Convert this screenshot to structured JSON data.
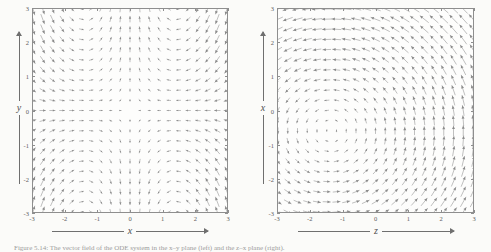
{
  "figure": {
    "caption": "Figure 5.14: The vector field of the ODE system in the x–y plane (left) and the z–x plane (right).",
    "caption_label": "Figure 5.14:"
  },
  "panels": [
    {
      "id": "left",
      "name": "xy-plane-quiver",
      "xlabel": "x",
      "ylabel": "y",
      "xticks": [
        "-3",
        "-2",
        "-1",
        "0",
        "1",
        "2",
        "3"
      ],
      "yticks": [
        "-3",
        "-2",
        "-1",
        "0",
        "1",
        "2",
        "3"
      ],
      "xlim": [
        -3,
        3
      ],
      "ylim": [
        -3,
        3
      ]
    },
    {
      "id": "right",
      "name": "zx-plane-quiver",
      "xlabel": "z",
      "ylabel": "x",
      "xticks": [
        "-3",
        "-2",
        "-1",
        "0",
        "1",
        "2",
        "3"
      ],
      "yticks": [
        "-3",
        "-2",
        "-1",
        "0",
        "1",
        "2",
        "3"
      ],
      "xlim": [
        -3,
        3
      ],
      "ylim": [
        -3,
        3
      ]
    }
  ],
  "chart_data": [
    {
      "type": "scatter",
      "subtype": "quiver",
      "panel": "left",
      "title": "",
      "xlabel": "x",
      "ylabel": "y",
      "xlim": [
        -3,
        3
      ],
      "ylim": [
        -3,
        3
      ],
      "xticks": [
        -3,
        -2,
        -1,
        0,
        1,
        2,
        3
      ],
      "yticks": [
        -3,
        -2,
        -1,
        0,
        1,
        2,
        3
      ],
      "grid": false,
      "legend": "none",
      "field_description": "Saddle-like flow: arrows converge toward the vertical axis and diverge away from the horizontal axis, forming hyperbolic streamlines around the origin.",
      "u_expression": "-x",
      "v_expression": "y*(1 - x*x/2)",
      "grid_n": 21,
      "arrow_color": "#8a8a8a"
    },
    {
      "type": "scatter",
      "subtype": "quiver",
      "panel": "right",
      "title": "",
      "xlabel": "z",
      "ylabel": "x",
      "xlim": [
        -3,
        3
      ],
      "ylim": [
        -3,
        3
      ],
      "xticks": [
        -3,
        -2,
        -1,
        0,
        1,
        2,
        3
      ],
      "yticks": [
        -3,
        -2,
        -1,
        0,
        1,
        2,
        3
      ],
      "grid": false,
      "legend": "none",
      "field_description": "Rotational flow with a centre near the left of the frame: arrows curve counter-clockwise on the left half and point predominantly upward on the right half.",
      "u_expression": "-(y + 0.6)",
      "v_expression": "(x + 1.4)*0.9",
      "grid_n": 21,
      "arrow_color": "#8a8a8a"
    }
  ],
  "colors": {
    "page_background": "#fbfbf9",
    "plot_background": "#fdfdfc",
    "frame": "#8e8e8e",
    "arrow": "#8a8a8a",
    "text": "#5d5d5d",
    "caption": "#9c9c9c"
  }
}
